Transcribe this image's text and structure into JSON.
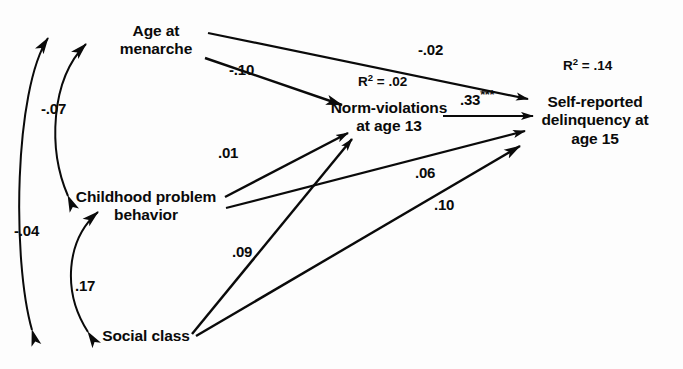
{
  "diagram": {
    "type": "path-diagram",
    "title": "",
    "nodes": [
      {
        "id": "menarche",
        "label_lines": [
          "Age at",
          "menarche"
        ]
      },
      {
        "id": "childhood",
        "label_lines": [
          "Childhood problem",
          "behavior"
        ]
      },
      {
        "id": "social",
        "label_lines": [
          "Social class"
        ]
      },
      {
        "id": "norm",
        "label_lines": [
          "Norm-violations",
          "at age 13"
        ]
      },
      {
        "id": "delinquency",
        "label_lines": [
          "Self-reported",
          "delinquency at",
          "age 15"
        ]
      }
    ],
    "r_squared": [
      {
        "id": "norm",
        "prefix": "R",
        "sup": "2",
        "value": "= .02",
        "full": "R2 = .02"
      },
      {
        "id": "delinquency",
        "prefix": "R",
        "sup": "2",
        "value": "= .14",
        "full": "R2 = .14"
      }
    ],
    "paths": [
      {
        "id": "menarche-to-norm",
        "from": "menarche",
        "to": "norm",
        "coefficient": "-.10",
        "stars": "",
        "kind": "directed"
      },
      {
        "id": "menarche-to-delinquency",
        "from": "menarche",
        "to": "delinquency",
        "coefficient": "-.02",
        "stars": "",
        "kind": "directed"
      },
      {
        "id": "childhood-to-norm",
        "from": "childhood",
        "to": "norm",
        "coefficient": ".01",
        "stars": "",
        "kind": "directed"
      },
      {
        "id": "childhood-to-delinquency",
        "from": "childhood",
        "to": "delinquency",
        "coefficient": ".06",
        "stars": "",
        "kind": "directed"
      },
      {
        "id": "social-to-norm",
        "from": "social",
        "to": "norm",
        "coefficient": ".09",
        "stars": "",
        "kind": "directed"
      },
      {
        "id": "social-to-delinquency",
        "from": "social",
        "to": "delinquency",
        "coefficient": ".10",
        "stars": "",
        "kind": "directed"
      },
      {
        "id": "norm-to-delinquency",
        "from": "norm",
        "to": "delinquency",
        "coefficient": ".33",
        "stars": "***",
        "kind": "directed"
      },
      {
        "id": "menarche-social-correlation",
        "from": "menarche",
        "to": "social",
        "coefficient": "-.04",
        "stars": "",
        "kind": "curved-double-headed"
      },
      {
        "id": "menarche-childhood-correlation",
        "from": "menarche",
        "to": "childhood",
        "coefficient": "-.07",
        "stars": "",
        "kind": "curved-double-headed"
      },
      {
        "id": "childhood-social-correlation",
        "from": "childhood",
        "to": "social",
        "coefficient": ".17",
        "stars": "",
        "kind": "curved-double-headed"
      }
    ],
    "colors": {
      "ink": "#0a0a0a",
      "background": "#fdfdfd"
    }
  }
}
